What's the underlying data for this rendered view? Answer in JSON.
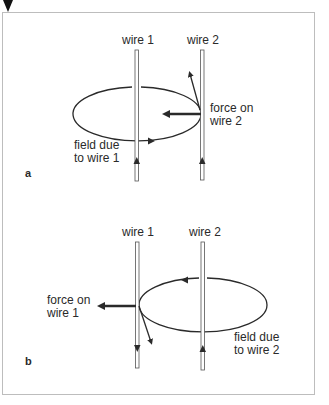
{
  "figure": {
    "marker": "down-triangle-marker",
    "panels": [
      {
        "id": "a",
        "tag": "a",
        "wire1_label": "wire 1",
        "wire2_label": "wire 2",
        "force_label_line1": "force on",
        "force_label_line2": "wire 2",
        "field_label_line1": "field due",
        "field_label_line2": "to wire 1"
      },
      {
        "id": "b",
        "tag": "b",
        "wire1_label": "wire 1",
        "wire2_label": "wire 2",
        "force_label_line1": "force on",
        "force_label_line2": "wire 1",
        "field_label_line1": "field due",
        "field_label_line2": "to wire 2"
      }
    ],
    "colors": {
      "ink": "#2a2a2a",
      "frame": "#bdbdbd",
      "background": "#ffffff"
    }
  }
}
